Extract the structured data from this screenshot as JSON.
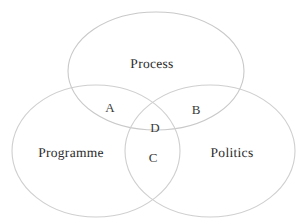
{
  "figure": {
    "type": "venn-diagram",
    "background_color": "#ffffff",
    "stroke_color": "#c9c9c9",
    "text_color": "#2b2b2b",
    "clipped_header_fragment": "· ·"
  },
  "sets": [
    {
      "id": "process",
      "label": "Process",
      "label_x": 152,
      "label_y": 64,
      "cx": 156,
      "cy": 71,
      "rx": 88,
      "ry": 59,
      "stroke": "#c9c9c9"
    },
    {
      "id": "programme",
      "label": "Programme",
      "label_x": 71,
      "label_y": 153,
      "cx": 96,
      "cy": 151,
      "rx": 84,
      "ry": 66,
      "stroke": "#cfcfcf"
    },
    {
      "id": "politics",
      "label": "Politics",
      "label_x": 232,
      "label_y": 153,
      "cx": 210,
      "cy": 151,
      "rx": 85,
      "ry": 66,
      "stroke": "#cfcfcf"
    }
  ],
  "regions": [
    {
      "id": "a",
      "label": "A",
      "members": "Process ∩ Programme",
      "x": 110,
      "y": 108
    },
    {
      "id": "b",
      "label": "B",
      "members": "Process ∩ Politics",
      "x": 196,
      "y": 110
    },
    {
      "id": "d",
      "label": "D",
      "members": "Process ∩ Programme ∩ Politics",
      "x": 155,
      "y": 128
    },
    {
      "id": "c",
      "label": "C",
      "members": "Programme ∩ Politics",
      "x": 153,
      "y": 158
    }
  ]
}
